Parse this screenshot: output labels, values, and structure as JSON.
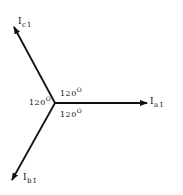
{
  "diagram": {
    "title": "",
    "origin": {
      "x": 55,
      "y": 103
    },
    "color": "#111111",
    "phasors": [
      {
        "id": "ia1",
        "symbol": "I",
        "subscript": "a1",
        "tip": {
          "x": 147,
          "y": 103
        },
        "label_pos": {
          "x": 150,
          "y": 96
        }
      },
      {
        "id": "ib1",
        "symbol": "I",
        "subscript": "b1",
        "tip": {
          "x": 12,
          "y": 180
        },
        "label_pos": {
          "x": 23,
          "y": 172
        }
      },
      {
        "id": "ic1",
        "symbol": "I",
        "subscript": "c1",
        "tip": {
          "x": 14,
          "y": 27
        },
        "label_pos": {
          "x": 18,
          "y": 16
        }
      }
    ],
    "angles": [
      {
        "id": "angle-ca",
        "value": "120",
        "unit": "O",
        "pos": {
          "x": 60,
          "y": 88
        }
      },
      {
        "id": "angle-bc",
        "value": "120",
        "unit": "O",
        "pos": {
          "x": 30,
          "y": 96
        }
      },
      {
        "id": "angle-ab",
        "value": "120",
        "unit": "O",
        "pos": {
          "x": 60,
          "y": 106
        }
      }
    ]
  }
}
